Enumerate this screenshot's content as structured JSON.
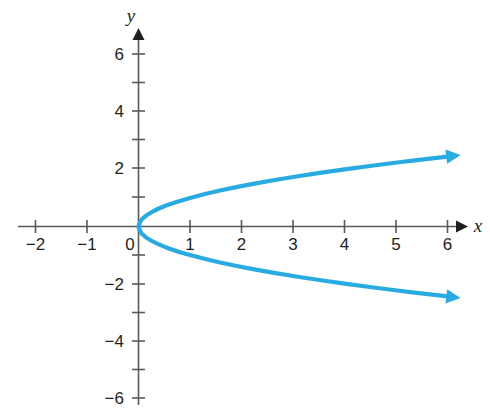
{
  "figure": {
    "background_color": "#ffffff",
    "width": 490,
    "height": 412
  },
  "chart_data": {
    "type": "line",
    "title": "",
    "subtitle": "",
    "xlabel": "x",
    "ylabel": "y",
    "grid": false,
    "legend": null,
    "axis_style": "arrowed-cartesian-axes",
    "axis_color": "#58595b",
    "curve_color": "#29abe2",
    "curve_width": 4,
    "xlim": [
      -2.35,
      6.45
    ],
    "ylim": [
      -6.35,
      6.35
    ],
    "xticks": [
      -2,
      -1,
      0,
      1,
      2,
      3,
      4,
      5,
      6
    ],
    "xtick_labels": [
      "−2",
      "−1",
      "0",
      "1",
      "2",
      "3",
      "4",
      "5",
      "6"
    ],
    "yticks": [
      -6,
      -5,
      -4,
      -3,
      -2,
      -1,
      1,
      2,
      3,
      4,
      5,
      6
    ],
    "ytick_labels_shown": [
      "6",
      "4",
      "2",
      "−2",
      "−4",
      "−6"
    ],
    "ytick_label_values": [
      6,
      4,
      2,
      -2,
      -4,
      -6
    ],
    "equation": "x = y²",
    "series": [
      {
        "name": "x = y² (upper branch)",
        "arrow_end": true,
        "points": [
          {
            "x": 0,
            "y": 0
          },
          {
            "x": 0.0625,
            "y": 0.25
          },
          {
            "x": 0.25,
            "y": 0.5
          },
          {
            "x": 0.5625,
            "y": 0.75
          },
          {
            "x": 1,
            "y": 1
          },
          {
            "x": 1.5625,
            "y": 1.25
          },
          {
            "x": 2.25,
            "y": 1.5
          },
          {
            "x": 3.0625,
            "y": 1.75
          },
          {
            "x": 4,
            "y": 2
          },
          {
            "x": 5.0625,
            "y": 2.25
          },
          {
            "x": 6.0025,
            "y": 2.45
          }
        ]
      },
      {
        "name": "x = y² (lower branch)",
        "arrow_end": true,
        "points": [
          {
            "x": 0,
            "y": 0
          },
          {
            "x": 0.0625,
            "y": -0.25
          },
          {
            "x": 0.25,
            "y": -0.5
          },
          {
            "x": 0.5625,
            "y": -0.75
          },
          {
            "x": 1,
            "y": -1
          },
          {
            "x": 1.5625,
            "y": -1.25
          },
          {
            "x": 2.25,
            "y": -1.5
          },
          {
            "x": 3.0625,
            "y": -1.75
          },
          {
            "x": 4,
            "y": -2
          },
          {
            "x": 5.0625,
            "y": -2.25
          },
          {
            "x": 6.0025,
            "y": -2.45
          }
        ]
      }
    ]
  }
}
